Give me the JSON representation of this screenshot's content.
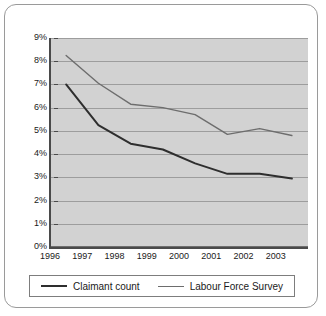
{
  "chart_data": {
    "type": "line",
    "title": "",
    "subtitle": "",
    "xlabel": "",
    "ylabel": "",
    "xlim": [
      1996,
      2004
    ],
    "ylim": [
      0,
      9
    ],
    "grid": true,
    "legend_position": "bottom",
    "y_ticks": [
      "0%",
      "1%",
      "2%",
      "3%",
      "4%",
      "5%",
      "6%",
      "7%",
      "8%",
      "9%"
    ],
    "y_tick_values": [
      0,
      1,
      2,
      3,
      4,
      5,
      6,
      7,
      8,
      9
    ],
    "x_ticks": [
      "1996",
      "1997",
      "1998",
      "1999",
      "2000",
      "2001",
      "2002",
      "2003"
    ],
    "x_tick_values": [
      1996,
      1997,
      1998,
      1999,
      2000,
      2001,
      2002,
      2003
    ],
    "x": [
      1996.5,
      1997.5,
      1998.5,
      1999.5,
      2000.5,
      2001.5,
      2002.5,
      2003.5
    ],
    "series": [
      {
        "name": "Claimant count",
        "color": "#2e2e2e",
        "width": 2,
        "values": [
          7.0,
          5.25,
          4.45,
          4.2,
          3.6,
          3.15,
          3.15,
          2.95
        ]
      },
      {
        "name": "Labour Force Survey",
        "color": "#6d6d6d",
        "width": 1.4,
        "values": [
          8.25,
          7.05,
          6.15,
          6.0,
          5.7,
          4.85,
          5.1,
          4.8
        ]
      }
    ]
  },
  "legend": {
    "items": [
      {
        "label": "Claimant count"
      },
      {
        "label": "Labour Force Survey"
      }
    ]
  },
  "colors": {
    "plot_background": "#d2d2d2",
    "gridline": "#9d9d9d",
    "axis": "#4a4a4a",
    "card_border": "#9a9a9a",
    "page_background": "#ffffff",
    "claimant_line": "#2e2e2e",
    "lfs_line": "#6d6d6d"
  }
}
